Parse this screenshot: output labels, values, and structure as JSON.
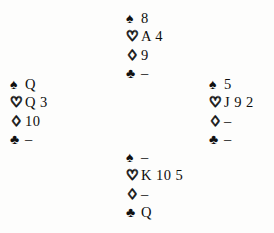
{
  "diagram": {
    "type": "bridge-deal-diagram",
    "void_symbol": "–",
    "suit_symbols": {
      "spades": "♠",
      "hearts": "♡",
      "diamonds": "♢",
      "clubs": "♣"
    },
    "suit_order": [
      "spades",
      "hearts",
      "diamonds",
      "clubs"
    ],
    "hands": {
      "north": {
        "spades": "8",
        "hearts": "A 4",
        "diamonds": "9",
        "clubs": "–"
      },
      "west": {
        "spades": "Q",
        "hearts": "Q 3",
        "diamonds": "10",
        "clubs": "–"
      },
      "east": {
        "spades": "5",
        "hearts": "J 9 2",
        "diamonds": "–",
        "clubs": "–"
      },
      "south": {
        "spades": "–",
        "hearts": "K 10 5",
        "diamonds": "–",
        "clubs": "Q"
      }
    }
  }
}
